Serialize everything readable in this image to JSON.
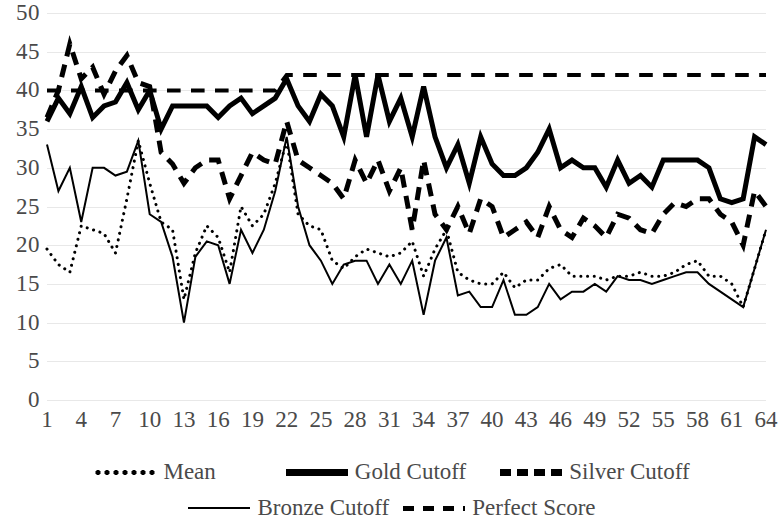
{
  "chart_data": {
    "type": "line",
    "title": "",
    "subtitle": "",
    "xlabel": "",
    "ylabel": "",
    "ylim": [
      0,
      50
    ],
    "xlim": [
      1,
      64
    ],
    "y_ticks": [
      0,
      5,
      10,
      15,
      20,
      25,
      30,
      35,
      40,
      45,
      50
    ],
    "x_ticks": [
      1,
      4,
      7,
      10,
      13,
      16,
      19,
      22,
      25,
      28,
      31,
      34,
      37,
      40,
      43,
      46,
      49,
      52,
      55,
      58,
      61,
      64
    ],
    "grid": true,
    "grid_color": "#e8e8e8",
    "legend_position": "bottom",
    "x": [
      1,
      2,
      3,
      4,
      5,
      6,
      7,
      8,
      9,
      10,
      11,
      12,
      13,
      14,
      15,
      16,
      17,
      18,
      19,
      20,
      21,
      22,
      23,
      24,
      25,
      26,
      27,
      28,
      29,
      30,
      31,
      32,
      33,
      34,
      35,
      36,
      37,
      38,
      39,
      40,
      41,
      42,
      43,
      44,
      45,
      46,
      47,
      48,
      49,
      50,
      51,
      52,
      53,
      54,
      55,
      56,
      57,
      58,
      59,
      60,
      61,
      62,
      63,
      64
    ],
    "series": [
      {
        "name": "Mean",
        "style": "dotted",
        "color": "#000000",
        "width": 3,
        "values": [
          19.5,
          17.5,
          16.5,
          22.5,
          22.0,
          21.5,
          19.0,
          26.0,
          33.5,
          28.0,
          23.0,
          22.0,
          13.0,
          19.0,
          22.5,
          21.0,
          16.5,
          25.0,
          22.5,
          24.0,
          28.0,
          33.5,
          24.0,
          22.5,
          22.0,
          18.0,
          17.0,
          18.5,
          19.5,
          19.0,
          18.5,
          19.0,
          20.5,
          16.0,
          19.5,
          22.0,
          16.5,
          15.5,
          15.0,
          15.0,
          16.5,
          14.5,
          15.5,
          15.5,
          17.0,
          17.5,
          16.0,
          16.0,
          16.0,
          15.5,
          16.0,
          16.0,
          16.5,
          16.0,
          16.0,
          16.5,
          17.5,
          18.0,
          16.0,
          16.0,
          15.0,
          12.0,
          17.0,
          22.0
        ]
      },
      {
        "name": "Gold Cutoff",
        "style": "solid-thick",
        "color": "#000000",
        "width": 5,
        "values": [
          36.0,
          39.0,
          37.0,
          40.5,
          36.5,
          38.0,
          38.5,
          41.0,
          37.5,
          40.0,
          35.0,
          38.0,
          38.0,
          38.0,
          38.0,
          36.5,
          38.0,
          39.0,
          37.0,
          38.0,
          39.0,
          41.5,
          38.0,
          36.0,
          39.5,
          38.0,
          34.0,
          42.0,
          34.0,
          42.0,
          36.0,
          39.0,
          34.0,
          40.5,
          34.0,
          30.0,
          33.0,
          28.0,
          34.0,
          30.5,
          29.0,
          29.0,
          30.0,
          32.0,
          35.0,
          30.0,
          31.0,
          30.0,
          30.0,
          27.5,
          31.0,
          28.0,
          29.0,
          27.5,
          31.0,
          31.0,
          31.0,
          31.0,
          30.0,
          26.0,
          25.5,
          26.0,
          34.0,
          33.0
        ]
      },
      {
        "name": "Silver Cutoff",
        "style": "dashed-thick",
        "color": "#000000",
        "width": 5,
        "values": [
          36.5,
          40.0,
          46.0,
          41.5,
          43.0,
          39.5,
          42.5,
          44.5,
          41.0,
          40.5,
          32.0,
          30.5,
          28.0,
          30.0,
          31.0,
          31.0,
          26.0,
          29.0,
          32.0,
          31.0,
          30.5,
          36.0,
          31.0,
          30.0,
          29.0,
          28.0,
          26.0,
          31.0,
          28.0,
          31.0,
          27.0,
          30.0,
          22.0,
          31.0,
          24.0,
          22.0,
          25.0,
          21.5,
          26.0,
          25.0,
          21.0,
          22.0,
          23.0,
          21.0,
          25.0,
          22.0,
          21.0,
          23.5,
          22.5,
          21.0,
          24.0,
          23.5,
          22.0,
          21.5,
          24.0,
          25.5,
          25.0,
          26.0,
          26.0,
          24.0,
          23.0,
          20.0,
          27.0,
          25.0
        ]
      },
      {
        "name": "Bronze Cutoff",
        "style": "solid-thin",
        "color": "#000000",
        "width": 2,
        "values": [
          33.0,
          27.0,
          30.0,
          23.0,
          30.0,
          30.0,
          29.0,
          29.5,
          33.5,
          24.0,
          23.0,
          18.5,
          10.0,
          18.5,
          20.5,
          20.0,
          15.0,
          22.0,
          19.0,
          22.0,
          27.0,
          34.0,
          25.0,
          20.0,
          18.0,
          15.0,
          17.5,
          18.0,
          18.0,
          15.0,
          17.5,
          15.0,
          18.0,
          11.0,
          18.0,
          21.0,
          13.5,
          14.0,
          12.0,
          12.0,
          15.5,
          11.0,
          11.0,
          12.0,
          15.0,
          13.0,
          14.0,
          14.0,
          15.0,
          14.0,
          16.0,
          15.5,
          15.5,
          15.0,
          15.5,
          16.0,
          16.5,
          16.5,
          15.0,
          14.0,
          13.0,
          12.0,
          17.0,
          22.0
        ]
      },
      {
        "name": "Perfect Score",
        "style": "dashed",
        "color": "#000000",
        "width": 4,
        "values": [
          40,
          40,
          40,
          40,
          40,
          40,
          40,
          40,
          40,
          40,
          40,
          40,
          40,
          40,
          40,
          40,
          40,
          40,
          40,
          40,
          40,
          42,
          42,
          42,
          42,
          42,
          42,
          42,
          42,
          42,
          42,
          42,
          42,
          42,
          42,
          42,
          42,
          42,
          42,
          42,
          42,
          42,
          42,
          42,
          42,
          42,
          42,
          42,
          42,
          42,
          42,
          42,
          42,
          42,
          42,
          42,
          42,
          42,
          42,
          42,
          42,
          42,
          42,
          42
        ]
      }
    ]
  },
  "legend": {
    "rows": [
      [
        {
          "label": "Mean",
          "style": "dotted"
        },
        {
          "label": "Gold Cutoff",
          "style": "solid-thick"
        },
        {
          "label": "Silver Cutoff",
          "style": "dashed-thick"
        }
      ],
      [
        {
          "label": "Bronze Cutoff",
          "style": "solid-thin"
        },
        {
          "label": "Perfect Score",
          "style": "dashed"
        }
      ]
    ],
    "items": [
      {
        "label": "Mean"
      },
      {
        "label": "Gold Cutoff"
      },
      {
        "label": "Silver Cutoff"
      },
      {
        "label": "Bronze Cutoff"
      },
      {
        "label": "Perfect Score"
      }
    ]
  },
  "axis": {
    "y_labels": [
      "50",
      "45",
      "40",
      "35",
      "30",
      "25",
      "20",
      "15",
      "10",
      "5",
      "0"
    ],
    "x_labels": [
      "1",
      "4",
      "7",
      "10",
      "13",
      "16",
      "19",
      "22",
      "25",
      "28",
      "31",
      "34",
      "37",
      "40",
      "43",
      "46",
      "49",
      "52",
      "55",
      "58",
      "61",
      "64"
    ]
  }
}
